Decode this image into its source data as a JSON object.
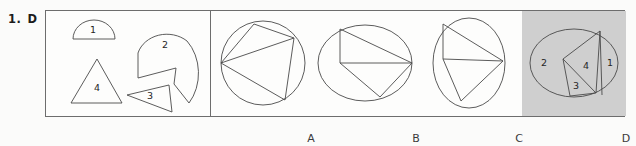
{
  "question": {
    "number": "1.",
    "answer": "D"
  },
  "colors": {
    "ink": "#3a3a3a",
    "border": "#6d6d6d",
    "shaded_background": "#cfcfcf",
    "panel_background": "#fdfdfc",
    "page_background": "#fbfbfa"
  },
  "prompt_panel": {
    "name": "pieces-panel",
    "pieces": [
      {
        "id": "1",
        "label": "1",
        "shape": "half-disc",
        "label_x": 47,
        "label_y": 19
      },
      {
        "id": "2",
        "label": "2",
        "shape": "large-notched-wedge",
        "label_x": 119,
        "label_y": 34
      },
      {
        "id": "3",
        "label": "3",
        "shape": "small-triangle",
        "label_x": 102,
        "label_y": 84
      },
      {
        "id": "4",
        "label": "4",
        "shape": "triangle",
        "label_x": 51,
        "label_y": 76
      }
    ]
  },
  "options": [
    {
      "letter": "A",
      "outline": "circle",
      "selected": false,
      "region_labels": []
    },
    {
      "letter": "B",
      "outline": "ellipse-wide",
      "selected": false,
      "region_labels": []
    },
    {
      "letter": "C",
      "outline": "ellipse-tall",
      "selected": false,
      "region_labels": []
    },
    {
      "letter": "D",
      "outline": "ellipse-wide",
      "selected": true,
      "region_labels": [
        {
          "label": "2",
          "x": 22,
          "y": 52
        },
        {
          "label": "4",
          "x": 66,
          "y": 55
        },
        {
          "label": "1",
          "x": 85,
          "y": 52
        },
        {
          "label": "3",
          "x": 53,
          "y": 74
        }
      ]
    }
  ]
}
